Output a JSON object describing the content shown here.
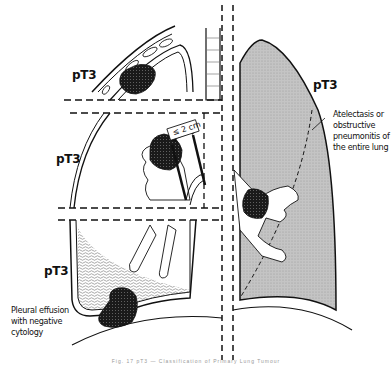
{
  "diagram": {
    "labels": {
      "chest_wall": "pT3",
      "bronchus": "pT3",
      "effusion": "pT3",
      "right_lung": "pT3"
    },
    "distance_marker": "≤ 2 cm",
    "annotations": {
      "atelectasis": [
        "Atelectasis or",
        "obstructive",
        "pneumonitis of",
        "the entire lung"
      ],
      "effusion": [
        "Pleural effusion",
        "with negative",
        "cytology"
      ]
    },
    "caption": "Fig. 17  pT3 — Classification of Primary Lung Tumour"
  },
  "colors": {
    "ink": "#111111",
    "lung_fill": "#bdbdbd",
    "background": "#ffffff",
    "tumor": "#1a1a1a"
  }
}
